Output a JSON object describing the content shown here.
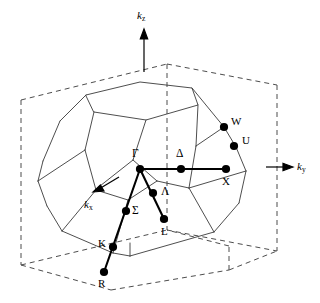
{
  "figure": {
    "type": "brillouin-zone-diagram",
    "stroke_color": "#000000",
    "background_color": "#ffffff",
    "solid_line_color": "#000000",
    "dashed_line_color": "#555555"
  },
  "axes": [
    {
      "id": "kz",
      "label": "k",
      "subscript": "z",
      "direction": "up",
      "x": 137,
      "y": 10
    },
    {
      "id": "ky",
      "label": "k",
      "subscript": "y",
      "direction": "right",
      "x": 296,
      "y": 160
    },
    {
      "id": "kx",
      "label": "k",
      "subscript": "x",
      "direction": "down-left",
      "x": 84,
      "y": 199
    }
  ],
  "points": [
    {
      "id": "gamma",
      "label": "Γ",
      "x": 140,
      "y": 169,
      "label_x": 132,
      "label_y": 152,
      "greek": true
    },
    {
      "id": "delta",
      "label": "Δ",
      "x": 181,
      "y": 169,
      "label_x": 175,
      "label_y": 152,
      "greek": true
    },
    {
      "id": "x",
      "label": "X",
      "x": 226,
      "y": 169,
      "label_x": 222,
      "label_y": 176,
      "greek": false
    },
    {
      "id": "w",
      "label": "W",
      "x": 224,
      "y": 127,
      "label_x": 231,
      "label_y": 116,
      "greek": false
    },
    {
      "id": "u",
      "label": "U",
      "x": 234,
      "y": 146,
      "label_x": 242,
      "label_y": 135,
      "greek": false
    },
    {
      "id": "lambda",
      "label": "Λ",
      "x": 153,
      "y": 193,
      "label_x": 160,
      "label_y": 186,
      "greek": true
    },
    {
      "id": "l",
      "label": "L",
      "x": 164,
      "y": 219,
      "label_x": 161,
      "label_y": 226,
      "greek": false
    },
    {
      "id": "sigma",
      "label": "Σ",
      "x": 126,
      "y": 211,
      "label_x": 132,
      "label_y": 206,
      "greek": true
    },
    {
      "id": "k",
      "label": "K",
      "x": 113,
      "y": 247,
      "label_x": 99,
      "label_y": 238,
      "greek": false
    },
    {
      "id": "r",
      "label": "R",
      "x": 104,
      "y": 272,
      "label_x": 99,
      "label_y": 278,
      "greek": false
    }
  ],
  "symmetry_lines": [
    {
      "id": "gamma-x",
      "from": "gamma",
      "to": "x",
      "via": "delta",
      "style": "thick"
    },
    {
      "id": "gamma-l",
      "from": "gamma",
      "to": "l",
      "via": "lambda",
      "style": "thick"
    },
    {
      "id": "gamma-r",
      "from": "gamma",
      "to": "r",
      "via": "sigma,k",
      "style": "thick"
    }
  ],
  "geometry": {
    "cube_dashed": [
      [
        21,
        100
      ],
      [
        21,
        265
      ],
      [
        167,
        290
      ],
      [
        275,
        252
      ],
      [
        275,
        84
      ],
      [
        167,
        64
      ],
      [
        21,
        100
      ],
      [
        131,
        76
      ],
      [
        275,
        84
      ],
      [
        131,
        76
      ],
      [
        131,
        243
      ],
      [
        167,
        290
      ],
      [
        131,
        243
      ],
      [
        21,
        265
      ]
    ],
    "polyhedron_vertices": {
      "top_face": [
        [
          87,
          96
        ],
        [
          144,
          83
        ],
        [
          202,
          92
        ],
        [
          205,
          107
        ],
        [
          151,
          120
        ],
        [
          95,
          110
        ]
      ],
      "note": "approximate projected hexagonal top face"
    }
  }
}
